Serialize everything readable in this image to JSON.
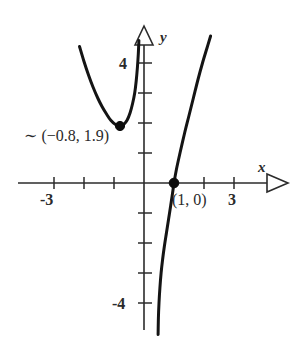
{
  "chart_data": {
    "type": "line",
    "title": "",
    "xlabel": "x",
    "ylabel": "y",
    "xlim": [
      -3.8,
      4.2
    ],
    "ylim": [
      -5.3,
      5.4
    ],
    "grid": false,
    "legend": "none",
    "axis_style": "open-triangle-arrowheads",
    "x_ticks": [
      -3,
      -2,
      -1,
      1,
      2,
      3
    ],
    "y_ticks": [
      1,
      2,
      3,
      4,
      -1,
      -2,
      -3,
      -4
    ],
    "x_tick_labels_shown": [
      "-3",
      "3"
    ],
    "y_tick_labels_shown": [
      "4",
      "-4"
    ],
    "series": [
      {
        "name": "parabola",
        "description": "upward-opening parabola with minimum near (-0.8, 1.9)",
        "points": [
          [
            -2.15,
            4.55
          ],
          [
            -2.0,
            4.05
          ],
          [
            -1.85,
            3.6
          ],
          [
            -1.7,
            3.2
          ],
          [
            -1.55,
            2.85
          ],
          [
            -1.4,
            2.55
          ],
          [
            -1.25,
            2.3
          ],
          [
            -1.1,
            2.08
          ],
          [
            -0.95,
            1.95
          ],
          [
            -0.8,
            1.9
          ],
          [
            -0.68,
            1.95
          ],
          [
            -0.56,
            2.1
          ],
          [
            -0.46,
            2.35
          ],
          [
            -0.38,
            2.65
          ],
          [
            -0.31,
            3.0
          ],
          [
            -0.26,
            3.4
          ],
          [
            -0.22,
            3.85
          ],
          [
            -0.19,
            4.3
          ],
          [
            -0.17,
            4.75
          ]
        ]
      },
      {
        "name": "cubic",
        "description": "steeply increasing curve crossing the x-axis at (1, 0)",
        "points": [
          [
            0.47,
            -5.05
          ],
          [
            0.48,
            -4.5
          ],
          [
            0.5,
            -4.0
          ],
          [
            0.53,
            -3.5
          ],
          [
            0.57,
            -3.0
          ],
          [
            0.62,
            -2.55
          ],
          [
            0.68,
            -2.1
          ],
          [
            0.75,
            -1.65
          ],
          [
            0.82,
            -1.2
          ],
          [
            0.89,
            -0.75
          ],
          [
            0.95,
            -0.35
          ],
          [
            1.0,
            0.0
          ],
          [
            1.08,
            0.45
          ],
          [
            1.2,
            1.0
          ],
          [
            1.35,
            1.65
          ],
          [
            1.5,
            2.25
          ],
          [
            1.65,
            2.85
          ],
          [
            1.8,
            3.45
          ],
          [
            1.95,
            4.0
          ],
          [
            2.1,
            4.5
          ],
          [
            2.22,
            4.9
          ]
        ]
      }
    ],
    "annotations": [
      {
        "name": "parabola-vertex",
        "text": "∼ (−0.8, 1.9)",
        "point": [
          -0.8,
          1.9
        ],
        "marker": "filled-dot",
        "label_position": "left-below"
      },
      {
        "name": "x-intercept",
        "text": "(1, 0)",
        "point": [
          1,
          0
        ],
        "marker": "filled-dot",
        "label_position": "below-right"
      }
    ]
  },
  "axes": {
    "x_axis_label": "x",
    "y_axis_label": "y"
  },
  "tick_labels": {
    "x_neg3": "-3",
    "x_pos3": "3",
    "y_pos4": "4",
    "y_neg4": "-4"
  },
  "annotations": {
    "vertex_text": "∼ (−0.8, 1.9)",
    "intercept_text": "(1, 0)"
  },
  "colors": {
    "background": "#ffffff",
    "axis": "#2b2b2b",
    "curve": "#141414",
    "text": "#2a2a2a"
  }
}
